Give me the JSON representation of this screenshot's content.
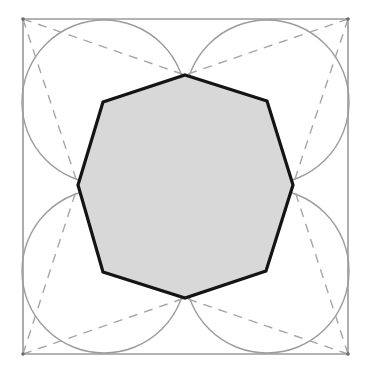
{
  "diagram": {
    "title": "",
    "colors": {
      "background": "#ffffff",
      "square_stroke": "#9a9a9a",
      "circle_stroke": "#9c9c9c",
      "dashed_stroke": "#a6a6a6",
      "octagon_fill": "#d8d8d8",
      "octagon_stroke": "#141414"
    },
    "square": {
      "corners": [
        [
          23,
          19
        ],
        [
          348,
          19
        ],
        [
          348,
          354
        ],
        [
          23,
          354
        ]
      ]
    },
    "circles": [
      {
        "name": "top-left",
        "cx": 104,
        "cy": 102,
        "r": 82
      },
      {
        "name": "top-right",
        "cx": 267,
        "cy": 102,
        "r": 82
      },
      {
        "name": "bottom-left",
        "cx": 104,
        "cy": 271,
        "r": 82
      },
      {
        "name": "bottom-right",
        "cx": 267,
        "cy": 271,
        "r": 82
      }
    ],
    "octagon": {
      "vertices": [
        [
          185,
          75
        ],
        [
          267,
          101
        ],
        [
          293,
          185
        ],
        [
          266,
          271
        ],
        [
          185,
          298
        ],
        [
          103,
          272
        ],
        [
          78,
          185
        ],
        [
          103,
          102
        ]
      ],
      "fill": "shaded"
    },
    "dashed_lines": [
      {
        "from": [
          23,
          19
        ],
        "to": [
          185,
          75
        ]
      },
      {
        "from": [
          23,
          19
        ],
        "to": [
          78,
          185
        ]
      },
      {
        "from": [
          348,
          19
        ],
        "to": [
          185,
          75
        ]
      },
      {
        "from": [
          348,
          19
        ],
        "to": [
          293,
          185
        ]
      },
      {
        "from": [
          23,
          354
        ],
        "to": [
          78,
          185
        ]
      },
      {
        "from": [
          23,
          354
        ],
        "to": [
          185,
          298
        ]
      },
      {
        "from": [
          348,
          354
        ],
        "to": [
          293,
          185
        ]
      },
      {
        "from": [
          348,
          354
        ],
        "to": [
          185,
          298
        ]
      }
    ]
  }
}
